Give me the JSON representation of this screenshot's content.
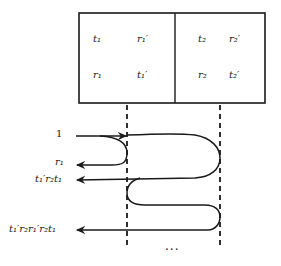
{
  "diagram": {
    "box": {
      "left_cell": {
        "top_left": "t₁",
        "top_right": "r₁′",
        "bottom_left": "r₁",
        "bottom_right": "t₁′"
      },
      "right_cell": {
        "top_left": "t₂",
        "top_right": "r₂′",
        "bottom_left": "r₂",
        "bottom_right": "t₂′"
      }
    },
    "labels": {
      "incident": "1",
      "reflect_1": "r₁",
      "reflect_2": "t₁′r₂t₁",
      "reflect_3": "t₁′r₂r₁′r₂t₁"
    },
    "ellipsis": "···",
    "colors": {
      "stroke": "#1a1a1a",
      "text": "#222222",
      "background": "#ffffff"
    }
  }
}
